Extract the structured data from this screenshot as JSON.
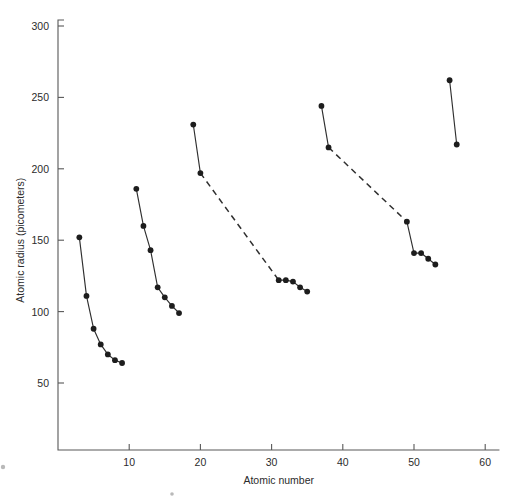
{
  "figure": {
    "background_color": "#ffffff",
    "ink_color": "#2f2f2f",
    "axis_color": "#585858"
  },
  "chart_data": {
    "type": "line",
    "title": "",
    "subtitle": "",
    "xlabel": "Atomic number",
    "ylabel": "Atomic radius (picometers)",
    "xlim": [
      0,
      62
    ],
    "ylim": [
      0,
      300
    ],
    "xticks": [
      10,
      20,
      30,
      40,
      50,
      60
    ],
    "xtick_labels": [
      "10",
      "20",
      "30",
      "40",
      "50",
      "60"
    ],
    "yticks": [
      50,
      100,
      150,
      200,
      250,
      300
    ],
    "ytick_labels": [
      "50",
      "100",
      "150",
      "200",
      "250",
      "300"
    ],
    "grid": false,
    "legend": "none",
    "marker": "filled-circle",
    "series": [
      {
        "name": "Period 2",
        "linestyle": "solid",
        "x": [
          3,
          4,
          5,
          6,
          7,
          8,
          9
        ],
        "y": [
          152,
          111,
          88,
          77,
          70,
          66,
          64
        ]
      },
      {
        "name": "Period 3",
        "linestyle": "solid",
        "x": [
          11,
          12,
          13,
          14,
          15,
          16,
          17
        ],
        "y": [
          186,
          160,
          143,
          117,
          110,
          104,
          99
        ]
      },
      {
        "name": "Period 4 (alkali/alkaline)",
        "linestyle": "solid",
        "x": [
          19,
          20
        ],
        "y": [
          231,
          197
        ]
      },
      {
        "name": "Period 4 (transition gap)",
        "linestyle": "dashed",
        "x": [
          20,
          31
        ],
        "y": [
          197,
          122
        ]
      },
      {
        "name": "Period 4 (post-transition)",
        "linestyle": "solid",
        "x": [
          31,
          32,
          33,
          34,
          35
        ],
        "y": [
          122,
          122,
          121,
          117,
          114
        ]
      },
      {
        "name": "Period 5 (alkali/alkaline)",
        "linestyle": "solid",
        "x": [
          37,
          38
        ],
        "y": [
          244,
          215
        ]
      },
      {
        "name": "Period 5 (transition gap)",
        "linestyle": "dashed",
        "x": [
          38,
          49
        ],
        "y": [
          215,
          163
        ]
      },
      {
        "name": "Period 5 (post-transition)",
        "linestyle": "solid",
        "x": [
          49,
          50,
          51,
          52,
          53
        ],
        "y": [
          163,
          141,
          141,
          137,
          133
        ]
      },
      {
        "name": "Period 6 (alkali/alkaline)",
        "linestyle": "solid",
        "x": [
          55,
          56
        ],
        "y": [
          262,
          217
        ]
      }
    ]
  }
}
